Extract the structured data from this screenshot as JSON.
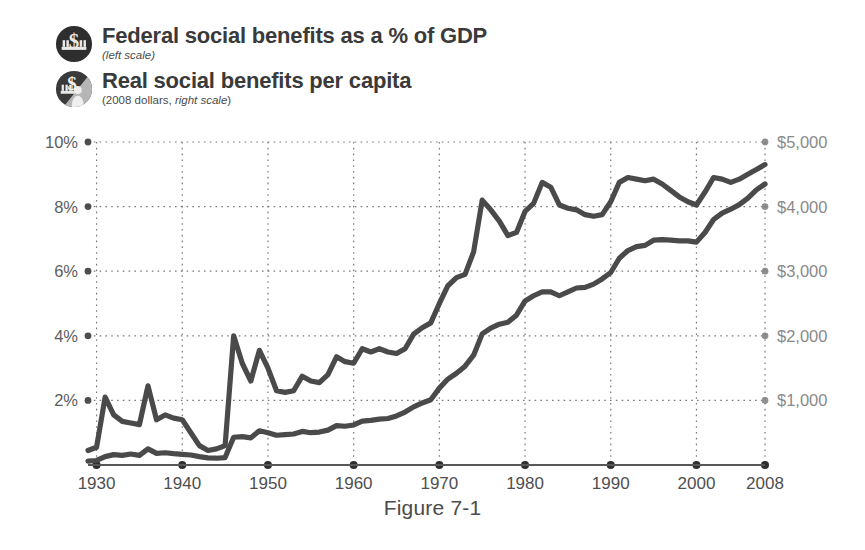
{
  "figure": {
    "caption": "Figure 7-1"
  },
  "legend": {
    "position": "top-left",
    "items": [
      {
        "icon": "dollar-capitol-badge-icon",
        "title": "Federal social benefits as a % of GDP",
        "subtitle_plain": "",
        "subtitle_italic": "(left scale)",
        "scale": "left",
        "color": "#4a4a4a"
      },
      {
        "icon": "dollar-person-badge-icon",
        "title": "Real social benefits per capita",
        "subtitle_plain": "(2008 dollars, ",
        "subtitle_italic": "right scale",
        "subtitle_tail": ")",
        "scale": "right",
        "color": "#4a4a4a"
      }
    ]
  },
  "chart_data": {
    "type": "line",
    "title": "",
    "xlabel": "",
    "ylabel": "",
    "grid": true,
    "xlim": [
      1929,
      2008
    ],
    "x_ticks": [
      1930,
      1940,
      1950,
      1960,
      1970,
      1980,
      1990,
      2000,
      2008
    ],
    "x_tick_labels": [
      "1930",
      "1940",
      "1950",
      "1960",
      "1970",
      "1980",
      "1990",
      "2000",
      "2008"
    ],
    "left_axis": {
      "label": "",
      "ylim": [
        0,
        10
      ],
      "ticks": [
        2,
        4,
        6,
        8,
        10
      ],
      "tick_labels": [
        "2%",
        "4%",
        "6%",
        "8%",
        "10%"
      ],
      "unit": "percent"
    },
    "right_axis": {
      "label": "",
      "ylim": [
        0,
        5000
      ],
      "ticks": [
        1000,
        2000,
        3000,
        4000,
        5000
      ],
      "tick_labels": [
        "$1,000",
        "$2,000",
        "$3,000",
        "$4,000",
        "$5,000"
      ],
      "unit": "2008 dollars"
    },
    "x": [
      1929,
      1930,
      1931,
      1932,
      1933,
      1934,
      1935,
      1936,
      1937,
      1938,
      1939,
      1940,
      1941,
      1942,
      1943,
      1944,
      1945,
      1946,
      1947,
      1948,
      1949,
      1950,
      1951,
      1952,
      1953,
      1954,
      1955,
      1956,
      1957,
      1958,
      1959,
      1960,
      1961,
      1962,
      1963,
      1964,
      1965,
      1966,
      1967,
      1968,
      1969,
      1970,
      1971,
      1972,
      1973,
      1974,
      1975,
      1976,
      1977,
      1978,
      1979,
      1980,
      1981,
      1982,
      1983,
      1984,
      1985,
      1986,
      1987,
      1988,
      1989,
      1990,
      1991,
      1992,
      1993,
      1994,
      1995,
      1996,
      1997,
      1998,
      1999,
      2000,
      2001,
      2002,
      2003,
      2004,
      2005,
      2006,
      2007,
      2008
    ],
    "series": [
      {
        "name": "Federal social benefits as a % of GDP",
        "axis": "left",
        "unit": "percent",
        "color": "#4a4a4a",
        "values": [
          0.45,
          0.55,
          2.1,
          1.55,
          1.35,
          1.3,
          1.25,
          2.45,
          1.4,
          1.55,
          1.45,
          1.4,
          1.0,
          0.6,
          0.45,
          0.5,
          0.6,
          4.0,
          3.15,
          2.6,
          3.55,
          3.0,
          2.3,
          2.25,
          2.3,
          2.75,
          2.6,
          2.55,
          2.8,
          3.35,
          3.2,
          3.15,
          3.6,
          3.5,
          3.6,
          3.5,
          3.45,
          3.6,
          4.05,
          4.25,
          4.4,
          5.0,
          5.55,
          5.8,
          5.9,
          6.6,
          8.2,
          7.9,
          7.55,
          7.1,
          7.2,
          7.85,
          8.1,
          8.75,
          8.6,
          8.05,
          7.95,
          7.9,
          7.75,
          7.7,
          7.75,
          8.15,
          8.75,
          8.9,
          8.85,
          8.8,
          8.85,
          8.7,
          8.5,
          8.3,
          8.15,
          8.05,
          8.45,
          8.9,
          8.85,
          8.75,
          8.85,
          9.0,
          9.15,
          9.3
        ]
      },
      {
        "name": "Real social benefits per capita",
        "axis": "right",
        "unit": "2008 dollars",
        "color": "#4a4a4a",
        "values": [
          60,
          70,
          130,
          160,
          150,
          170,
          150,
          250,
          180,
          190,
          175,
          165,
          155,
          130,
          110,
          105,
          115,
          430,
          440,
          420,
          530,
          500,
          460,
          470,
          480,
          520,
          500,
          510,
          540,
          610,
          600,
          620,
          680,
          690,
          710,
          720,
          760,
          820,
          900,
          960,
          1010,
          1190,
          1330,
          1420,
          1530,
          1700,
          2030,
          2120,
          2180,
          2210,
          2320,
          2540,
          2620,
          2680,
          2680,
          2620,
          2680,
          2740,
          2750,
          2800,
          2880,
          2980,
          3200,
          3320,
          3380,
          3400,
          3480,
          3490,
          3480,
          3470,
          3470,
          3450,
          3600,
          3800,
          3900,
          3960,
          4030,
          4130,
          4260,
          4350
        ]
      }
    ],
    "annotations": []
  }
}
